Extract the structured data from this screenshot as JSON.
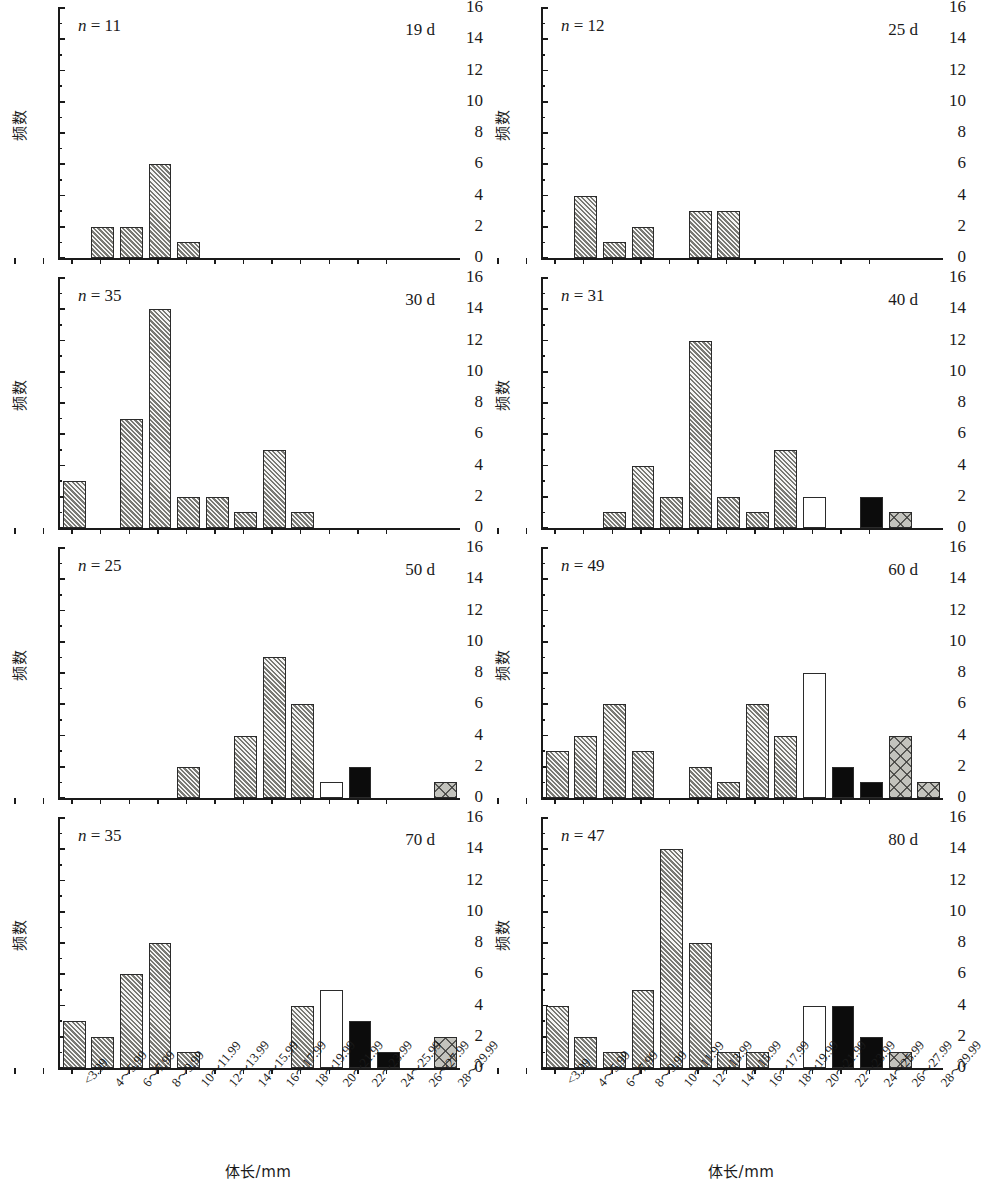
{
  "figure": {
    "axis": {
      "y_label": "频数",
      "y_ticks": [
        0,
        2,
        4,
        6,
        8,
        10,
        12,
        14,
        16
      ],
      "y_min": 0,
      "y_max": 16,
      "x_label_cn": "体长",
      "x_label_unit": "/mm",
      "x_label_full": "体长/mm",
      "categories": [
        "<3.99",
        "4～5.99",
        "6～7.99",
        "8～9.99",
        "10～11.99",
        "12～13.99",
        "14～15.99",
        "16～17.99",
        "18～19.99",
        "20～21.99",
        "22～23.99",
        "24～25.99",
        "26～27.99",
        "28～29.99"
      ]
    },
    "legend_patterns": {
      "hatch": "diagonal-hatched-grey",
      "cross": "cross-hatched-grey",
      "black": "solid-black",
      "white": "hollow-white"
    }
  },
  "chart_data": [
    {
      "type": "bar",
      "title": "19 d",
      "n_label": "n = 11",
      "n_value": 11,
      "xlabel": "体长/mm",
      "ylabel": "频数",
      "ylim": [
        0,
        16
      ],
      "grid": false,
      "categories": [
        "<3.99",
        "4～5.99",
        "6～7.99",
        "8～9.99",
        "10～11.99",
        "12～13.99",
        "14～15.99",
        "16～17.99",
        "18～19.99",
        "20～21.99",
        "22～23.99",
        "24～25.99",
        "26～27.99",
        "28～29.99"
      ],
      "values": [
        0,
        2,
        2,
        6,
        1,
        0,
        0,
        0,
        0,
        0,
        0,
        0,
        0,
        0
      ],
      "patterns": [
        "none",
        "hatch",
        "hatch",
        "hatch",
        "hatch",
        "none",
        "none",
        "none",
        "none",
        "none",
        "none",
        "none",
        "none",
        "none"
      ]
    },
    {
      "type": "bar",
      "title": "25 d",
      "n_label": "n = 12",
      "n_value": 12,
      "xlabel": "体长/mm",
      "ylabel": "频数",
      "ylim": [
        0,
        16
      ],
      "grid": false,
      "categories": [
        "<3.99",
        "4～5.99",
        "6～7.99",
        "8～9.99",
        "10～11.99",
        "12～13.99",
        "14～15.99",
        "16～17.99",
        "18～19.99",
        "20～21.99",
        "22～23.99",
        "24～25.99",
        "26～27.99",
        "28～29.99"
      ],
      "values": [
        0,
        4,
        1,
        2,
        0,
        3,
        3,
        0,
        0,
        0,
        0,
        0,
        0,
        0
      ],
      "patterns": [
        "none",
        "hatch",
        "hatch",
        "hatch",
        "none",
        "hatch",
        "hatch",
        "none",
        "none",
        "none",
        "none",
        "none",
        "none",
        "none"
      ]
    },
    {
      "type": "bar",
      "title": "30 d",
      "n_label": "n = 35",
      "n_value": 35,
      "xlabel": "体长/mm",
      "ylabel": "频数",
      "ylim": [
        0,
        16
      ],
      "grid": false,
      "categories": [
        "<3.99",
        "4～5.99",
        "6～7.99",
        "8～9.99",
        "10～11.99",
        "12～13.99",
        "14～15.99",
        "16～17.99",
        "18～19.99",
        "20～21.99",
        "22～23.99",
        "24～25.99",
        "26～27.99",
        "28～29.99"
      ],
      "values": [
        3,
        0,
        7,
        14,
        2,
        2,
        1,
        5,
        1,
        0,
        0,
        0,
        0,
        0
      ],
      "patterns": [
        "hatch",
        "none",
        "hatch",
        "hatch",
        "hatch",
        "hatch",
        "hatch",
        "hatch",
        "hatch",
        "none",
        "none",
        "none",
        "none",
        "none"
      ]
    },
    {
      "type": "bar",
      "title": "40 d",
      "n_label": "n = 31",
      "n_value": 31,
      "xlabel": "体长/mm",
      "ylabel": "频数",
      "ylim": [
        0,
        16
      ],
      "grid": false,
      "categories": [
        "<3.99",
        "4～5.99",
        "6～7.99",
        "8～9.99",
        "10～11.99",
        "12～13.99",
        "14～15.99",
        "16～17.99",
        "18～19.99",
        "20～21.99",
        "22～23.99",
        "24～25.99",
        "26～27.99",
        "28～29.99"
      ],
      "values": [
        0,
        0,
        1,
        4,
        2,
        12,
        2,
        1,
        5,
        2,
        0,
        2,
        1,
        0
      ],
      "patterns": [
        "none",
        "none",
        "hatch",
        "hatch",
        "hatch",
        "hatch",
        "hatch",
        "hatch",
        "hatch",
        "white",
        "none",
        "black",
        "cross",
        "none"
      ]
    },
    {
      "type": "bar",
      "title": "50 d",
      "n_label": "n = 25",
      "n_value": 25,
      "xlabel": "体长/mm",
      "ylabel": "频数",
      "ylim": [
        0,
        16
      ],
      "grid": false,
      "categories": [
        "<3.99",
        "4～5.99",
        "6～7.99",
        "8～9.99",
        "10～11.99",
        "12～13.99",
        "14～15.99",
        "16～17.99",
        "18～19.99",
        "20～21.99",
        "22～23.99",
        "24～25.99",
        "26～27.99",
        "28～29.99"
      ],
      "values": [
        0,
        0,
        0,
        0,
        2,
        0,
        4,
        9,
        6,
        1,
        2,
        0,
        0,
        1
      ],
      "patterns": [
        "none",
        "none",
        "none",
        "none",
        "hatch",
        "none",
        "hatch",
        "hatch",
        "hatch",
        "white",
        "black",
        "none",
        "none",
        "cross"
      ]
    },
    {
      "type": "bar",
      "title": "60 d",
      "n_label": "n = 49",
      "n_value": 49,
      "xlabel": "体长/mm",
      "ylabel": "频数",
      "ylim": [
        0,
        16
      ],
      "grid": false,
      "categories": [
        "<3.99",
        "4～5.99",
        "6～7.99",
        "8～9.99",
        "10～11.99",
        "12～13.99",
        "14～15.99",
        "16～17.99",
        "18～19.99",
        "20～21.99",
        "22～23.99",
        "24～25.99",
        "26～27.99",
        "28～29.99"
      ],
      "values": [
        3,
        4,
        6,
        3,
        0,
        2,
        1,
        6,
        4,
        8,
        2,
        1,
        4,
        1
      ],
      "patterns": [
        "hatch",
        "hatch",
        "hatch",
        "hatch",
        "none",
        "hatch",
        "hatch",
        "hatch",
        "hatch",
        "white",
        "black",
        "black",
        "cross",
        "cross"
      ]
    },
    {
      "type": "bar",
      "title": "70 d",
      "n_label": "n = 35",
      "n_value": 35,
      "xlabel": "体长/mm",
      "ylabel": "频数",
      "ylim": [
        0,
        16
      ],
      "grid": false,
      "categories": [
        "<3.99",
        "4～5.99",
        "6～7.99",
        "8～9.99",
        "10～11.99",
        "12～13.99",
        "14～15.99",
        "16～17.99",
        "18～19.99",
        "20～21.99",
        "22～23.99",
        "24～25.99",
        "26～27.99",
        "28～29.99"
      ],
      "values": [
        3,
        2,
        6,
        8,
        1,
        0,
        0,
        0,
        4,
        5,
        3,
        1,
        0,
        2
      ],
      "patterns": [
        "hatch",
        "hatch",
        "hatch",
        "hatch",
        "hatch",
        "none",
        "none",
        "none",
        "hatch",
        "white",
        "black",
        "black",
        "none",
        "cross"
      ]
    },
    {
      "type": "bar",
      "title": "80 d",
      "n_label": "n = 47",
      "n_value": 47,
      "xlabel": "体长/mm",
      "ylabel": "频数",
      "ylim": [
        0,
        16
      ],
      "grid": false,
      "categories": [
        "<3.99",
        "4～5.99",
        "6～7.99",
        "8～9.99",
        "10～11.99",
        "12～13.99",
        "14～15.99",
        "16～17.99",
        "18～19.99",
        "20～21.99",
        "22～23.99",
        "24～25.99",
        "26～27.99",
        "28～29.99"
      ],
      "values": [
        4,
        2,
        1,
        5,
        14,
        8,
        1,
        1,
        0,
        4,
        4,
        2,
        1,
        0
      ],
      "patterns": [
        "hatch",
        "hatch",
        "hatch",
        "hatch",
        "hatch",
        "hatch",
        "hatch",
        "hatch",
        "none",
        "white",
        "black",
        "black",
        "cross",
        "none"
      ]
    }
  ]
}
